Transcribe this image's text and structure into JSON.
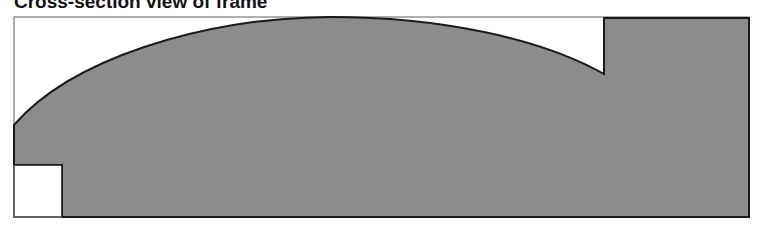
{
  "title": "Cross-section view of frame",
  "diagram": {
    "type": "cross-section",
    "colors": {
      "fill": "#8c8c8c",
      "outline": "#1a1a1a",
      "border": "#7a7a7a",
      "background": "#ffffff"
    },
    "frame_bounds": {
      "left": 14,
      "top": 17,
      "right": 749,
      "bottom": 217
    },
    "regions": [
      {
        "name": "curved-top-profile",
        "description": "Arched upper profile rising from left edge to a peak and descending to a step"
      },
      {
        "name": "right-raised-block",
        "description": "Rectangular raised section on right side"
      },
      {
        "name": "bottom-left-notch",
        "description": "Rectangular cut-out at bottom-left corner"
      }
    ]
  }
}
